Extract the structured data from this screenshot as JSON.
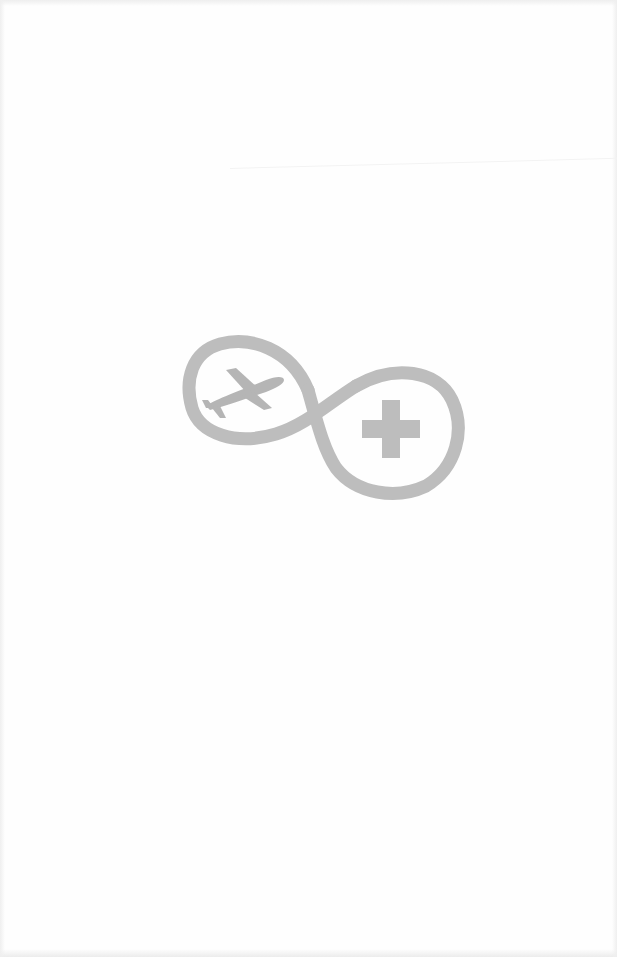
{
  "page": {
    "background": "#fefefe"
  },
  "logo": {
    "name": "infinity-travel-medical-logo",
    "color": "#bdbdbd",
    "icons": [
      "infinity-ribbon-icon",
      "airplane-icon",
      "medical-cross-icon"
    ]
  }
}
